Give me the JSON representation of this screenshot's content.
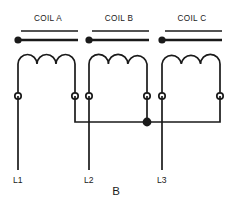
{
  "figure": {
    "caption": "B",
    "caption_x": 116,
    "caption_y": 192,
    "background": "#ffffff",
    "ink": "#1a1a1a"
  },
  "geometry": {
    "coil_top_y": 64,
    "coil_peak_y": 59,
    "terminal_y": 96,
    "bus_y": 122,
    "lead_bottom_y": 170,
    "label_y": 181,
    "terminal_radius": 3.2,
    "node_radius": 4.4,
    "polarity_radius": 3.6
  },
  "coils": [
    {
      "id": "coil-a",
      "label": "COIL A",
      "label_x": 48,
      "label_y": 19,
      "rule_thin": {
        "x1": 21,
        "x2": 78,
        "y": 31
      },
      "rule_thick": {
        "x1": 19,
        "x2": 78,
        "y": 40
      },
      "polarity_dot": {
        "cx": 18,
        "cy": 40
      },
      "left_terminal_x": 18,
      "right_terminal_x": 75,
      "arc_count": 3
    },
    {
      "id": "coil-b",
      "label": "COIL B",
      "label_x": 119,
      "label_y": 19,
      "rule_thin": {
        "x1": 92,
        "x2": 149,
        "y": 31
      },
      "rule_thick": {
        "x1": 90,
        "x2": 149,
        "y": 40
      },
      "polarity_dot": {
        "cx": 89,
        "cy": 40
      },
      "left_terminal_x": 89,
      "right_terminal_x": 147,
      "arc_count": 3
    },
    {
      "id": "coil-c",
      "label": "COIL C",
      "label_x": 192,
      "label_y": 19,
      "rule_thin": {
        "x1": 165,
        "x2": 222,
        "y": 31
      },
      "rule_thick": {
        "x1": 163,
        "x2": 222,
        "y": 40
      },
      "polarity_dot": {
        "cx": 162,
        "cy": 40
      },
      "left_terminal_x": 162,
      "right_terminal_x": 220,
      "arc_count": 3
    }
  ],
  "line_leads": [
    {
      "id": "lead-l1",
      "label": "L1",
      "x": 18,
      "label_x": 13
    },
    {
      "id": "lead-l2",
      "label": "L2",
      "x": 89,
      "label_x": 84
    },
    {
      "id": "lead-l3",
      "label": "L3",
      "x": 162,
      "label_x": 157
    }
  ],
  "bus": {
    "id": "interconnect-bus",
    "x1": 75,
    "x2": 220,
    "y": 122
  },
  "junction_node": {
    "id": "junction-dot",
    "cx": 147,
    "cy": 122
  }
}
